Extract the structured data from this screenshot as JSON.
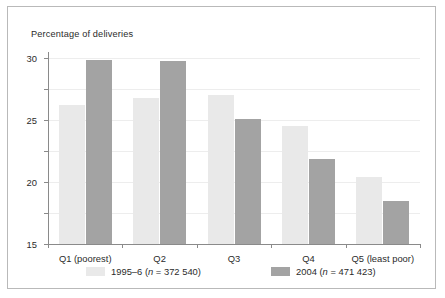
{
  "chart_data": {
    "type": "bar",
    "title": "Percentage of deliveries",
    "xlabel": "",
    "ylabel": "Percentage of deliveries",
    "categories": [
      "Q1 (poorest)",
      "Q2",
      "Q3",
      "Q4",
      "Q5 (least poor)"
    ],
    "series": [
      {
        "name": "1995–6 (n = 372 540)",
        "label_prefix": "1995–6 (",
        "label_italic": "n",
        "label_suffix": " = 372 540)",
        "color": "#e9e9e9",
        "values": [
          22.5,
          23.5,
          24.0,
          19.0,
          10.8
        ]
      },
      {
        "name": "2004 (n = 471 423)",
        "label_prefix": "2004 (",
        "label_italic": "n",
        "label_suffix": " = 471 423)",
        "color": "#a3a3a3",
        "values": [
          29.6,
          29.5,
          20.2,
          13.7,
          6.9
        ]
      }
    ],
    "ylim": [
      0,
      30
    ],
    "yticks": [
      0,
      5,
      10,
      15,
      20,
      25,
      30
    ],
    "ytick_labels": [
      "0",
      "5",
      "10",
      "15",
      "20",
      "25",
      "30"
    ],
    "grid": true,
    "legend_position": "bottom"
  },
  "figure": {
    "border_color": "#b9b9b9",
    "background": "#ffffff",
    "axis_color": "#8a8a8a",
    "gridline_color": "#ededed",
    "text_color": "#2b2b2b"
  }
}
